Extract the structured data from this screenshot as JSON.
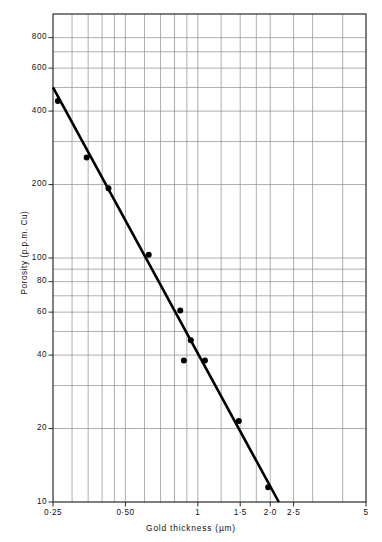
{
  "chart_data": {
    "type": "scatter",
    "title": "",
    "xlabel": "Gold thickness (µm)",
    "ylabel": "Porosity (p.p.m. Cu)",
    "xscale": "log",
    "yscale": "log",
    "xlim": [
      0.25,
      5
    ],
    "ylim": [
      10,
      1000
    ],
    "grid": true,
    "legend": null,
    "xticks": [
      {
        "value": 0.25,
        "label": "0·25"
      },
      {
        "value": 0.5,
        "label": "0·50"
      },
      {
        "value": 1.0,
        "label": "1"
      },
      {
        "value": 1.5,
        "label": "1·5"
      },
      {
        "value": 2.0,
        "label": "2·0"
      },
      {
        "value": 2.5,
        "label": "2·5"
      },
      {
        "value": 5.0,
        "label": "5"
      }
    ],
    "x_gridlines": [
      0.25,
      0.3,
      0.35,
      0.4,
      0.45,
      0.5,
      0.6,
      0.7,
      0.8,
      0.9,
      1.0,
      1.25,
      1.5,
      1.75,
      2.0,
      2.5,
      3.0,
      4.0,
      5.0
    ],
    "yticks": [
      {
        "value": 800,
        "label": "800"
      },
      {
        "value": 600,
        "label": "600"
      },
      {
        "value": 400,
        "label": "400"
      },
      {
        "value": 200,
        "label": "200"
      },
      {
        "value": 100,
        "label": "100"
      },
      {
        "value": 80,
        "label": "80"
      },
      {
        "value": 60,
        "label": "60"
      },
      {
        "value": 40,
        "label": "40"
      },
      {
        "value": 20,
        "label": "20"
      },
      {
        "value": 10,
        "label": "10"
      }
    ],
    "y_gridlines": [
      1000,
      800,
      700,
      600,
      500,
      400,
      300,
      200,
      100,
      90,
      80,
      70,
      60,
      50,
      40,
      30,
      20,
      10
    ],
    "points": [
      {
        "x": 0.262,
        "y": 440
      },
      {
        "x": 0.345,
        "y": 258
      },
      {
        "x": 0.425,
        "y": 193
      },
      {
        "x": 0.625,
        "y": 103
      },
      {
        "x": 0.845,
        "y": 61
      },
      {
        "x": 0.935,
        "y": 46
      },
      {
        "x": 0.875,
        "y": 38
      },
      {
        "x": 1.07,
        "y": 38
      },
      {
        "x": 1.48,
        "y": 21.5
      },
      {
        "x": 1.96,
        "y": 11.5
      }
    ],
    "fit_line": {
      "x_start": 0.25,
      "y_start": 500,
      "x_end": 2.17,
      "y_end": 10
    },
    "series_color": "#000000",
    "grid_color": "#8c8c8c",
    "axis_color": "#2b2b2b"
  }
}
